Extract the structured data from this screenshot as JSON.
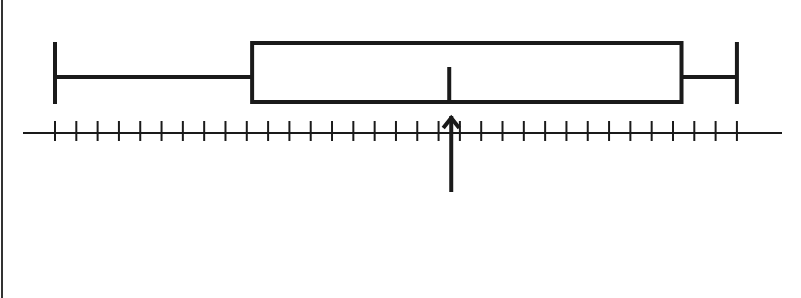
{
  "chart_data": {
    "type": "boxplot",
    "title": "",
    "xlabel": "",
    "ylabel": "",
    "orientation": "horizontal",
    "axis": {
      "tick_count": 33,
      "tick_labels": [],
      "range": [
        0,
        32
      ],
      "grid": false
    },
    "box": {
      "min": 0,
      "q1": 9.25,
      "median": 18.5,
      "q3": 29.4,
      "max": 32
    },
    "annotations": [
      {
        "type": "arrow",
        "direction": "up",
        "points_to": 18.5,
        "label": ""
      }
    ],
    "legend": null
  },
  "style": {
    "stroke_color": "#1a1a1a",
    "background": "#ffffff",
    "border_color": "#333333"
  },
  "layout": {
    "axis_y": 133,
    "axis_x_start": 23,
    "axis_x_end": 782,
    "scale_origin_x": 55,
    "scale_unit_px": 21.31,
    "box_top": 43,
    "box_bottom": 102,
    "whisker_y": 77,
    "cap_top": 42,
    "cap_bottom": 104,
    "median_top": 67,
    "tick_top": 121,
    "tick_bottom": 141,
    "arrow_tip_y": 114,
    "arrow_tail_y": 192
  }
}
